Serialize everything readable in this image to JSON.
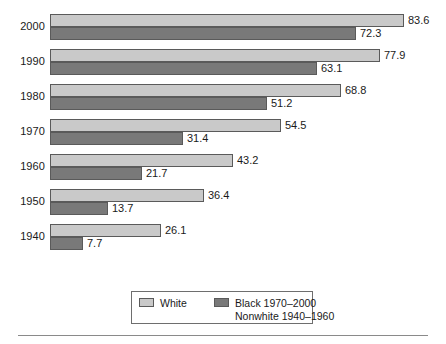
{
  "chart_data": {
    "type": "bar",
    "orientation": "horizontal",
    "title": "",
    "subtitle": "",
    "xlabel": "",
    "ylabel": "",
    "grid": false,
    "xlim": [
      0,
      83.6
    ],
    "axis_visible": false,
    "legend_position": "bottom-center",
    "categories": [
      "2000",
      "1990",
      "1980",
      "1970",
      "1960",
      "1950",
      "1940"
    ],
    "series": [
      {
        "name": "White",
        "color": "#c9c9c9",
        "values": [
          83.6,
          77.9,
          68.8,
          54.5,
          43.2,
          36.4,
          26.1
        ]
      },
      {
        "name": "Black 1970–2000",
        "name_line2": "Nonwhite 1940–1960",
        "color": "#797979",
        "values": [
          72.3,
          63.1,
          51.2,
          31.4,
          21.7,
          13.7,
          7.7
        ]
      }
    ],
    "data_labels": [
      {
        "category": "2000",
        "white": "83.6",
        "black": "72.3"
      },
      {
        "category": "1990",
        "white": "77.9",
        "black": "63.1"
      },
      {
        "category": "1980",
        "white": "68.8",
        "black": "51.2"
      },
      {
        "category": "1970",
        "white": "54.5",
        "black": "31.4"
      },
      {
        "category": "1960",
        "white": "43.2",
        "black": "21.7"
      },
      {
        "category": "1950",
        "white": "36.4",
        "black": "13.7"
      },
      {
        "category": "1940",
        "white": "26.1",
        "black": "7.7"
      }
    ]
  },
  "legend": {
    "entries": [
      {
        "label": "White",
        "swatch": "#c9c9c9"
      },
      {
        "label": "Black 1970–2000",
        "swatch": "#797979"
      }
    ],
    "second_line": "Nonwhite 1940–1960"
  },
  "colors": {
    "white_series": "#c9c9c9",
    "black_series": "#797979",
    "bar_border": "#5a5a5a",
    "text": "#1a1a1a",
    "rule": "#8a8a8a",
    "background": "#ffffff"
  }
}
